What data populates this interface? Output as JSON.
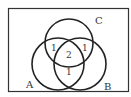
{
  "diagram": {
    "type": "venn",
    "sets": [
      {
        "name": "A",
        "label": "A"
      },
      {
        "name": "B",
        "label": "B"
      },
      {
        "name": "C",
        "label": "C"
      }
    ],
    "regions": [
      {
        "sets": [
          "A",
          "C"
        ],
        "only_pairwise": true,
        "value": "1"
      },
      {
        "sets": [
          "B",
          "C"
        ],
        "only_pairwise": true,
        "value": "1"
      },
      {
        "sets": [
          "A",
          "B",
          "C"
        ],
        "value": "2"
      },
      {
        "sets": [
          "A",
          "B"
        ],
        "only_pairwise": true,
        "value": "1"
      }
    ],
    "colors": {
      "stroke": "#222222",
      "text": "#333333",
      "background": "#ffffff"
    }
  }
}
